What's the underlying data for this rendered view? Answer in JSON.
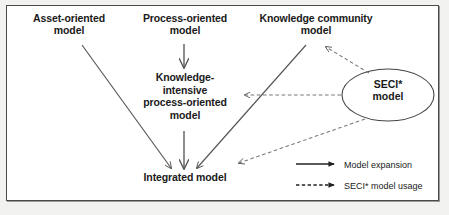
{
  "figure": {
    "type": "block-arrow-diagram",
    "background_color": "#ffffff",
    "border_color": "#4a4a4a",
    "text_color": "#1a1a1a",
    "arrow_color": "#555555"
  },
  "nodes": {
    "asset": {
      "label": "Asset-oriented\nmodel"
    },
    "process": {
      "label": "Process-oriented\nmodel"
    },
    "community": {
      "label": "Knowledge community\nmodel"
    },
    "kipo": {
      "label": "Knowledge-\nintensive\nprocess-oriented\nmodel"
    },
    "integrated": {
      "label": "Integrated model"
    },
    "seci": {
      "label": "SECI*\nmodel"
    }
  },
  "legend": {
    "solid": {
      "label": "Model expansion",
      "style": "solid"
    },
    "dashed": {
      "label": "SECI* model usage",
      "style": "dashed"
    }
  },
  "edges": [
    {
      "from": "asset",
      "to": "integrated",
      "style": "solid"
    },
    {
      "from": "process",
      "to": "kipo",
      "style": "solid"
    },
    {
      "from": "community",
      "to": "integrated",
      "style": "solid"
    },
    {
      "from": "kipo",
      "to": "integrated",
      "style": "solid"
    },
    {
      "from": "seci",
      "to": "community",
      "style": "dashed"
    },
    {
      "from": "seci",
      "to": "kipo",
      "style": "dashed"
    },
    {
      "from": "seci",
      "to": "integrated",
      "style": "dashed"
    }
  ]
}
